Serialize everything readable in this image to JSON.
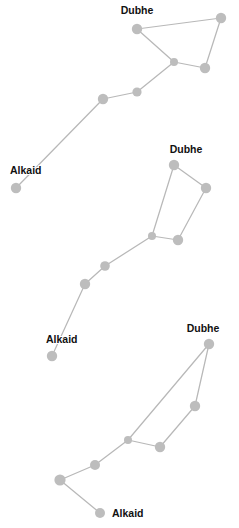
{
  "page": {
    "background_color": "#ffffff",
    "width": 239,
    "height": 528
  },
  "style": {
    "node_color": "#bdbdbd",
    "edge_color": "#b8b8b8",
    "label_color": "#111111",
    "edge_width": 1.25
  },
  "labels": {
    "dubhe": "Dubhe",
    "alkaid": "Alkaid"
  },
  "chart_data": {
    "type": "diagram",
    "xlabel": "",
    "ylabel": "",
    "xlim": [
      0,
      239
    ],
    "ylim": [
      0,
      528
    ],
    "grid": false,
    "legend": "none",
    "constellations": [
      {
        "name": "constellation-top",
        "stars": [
          {
            "id": "t0",
            "label": "Dubhe",
            "x": 137,
            "y": 29,
            "r": 5.2,
            "label_x": 137,
            "label_y": 14,
            "label_anchor": "middle"
          },
          {
            "id": "t1",
            "label": "",
            "x": 221,
            "y": 18,
            "r": 5.2
          },
          {
            "id": "t2",
            "label": "",
            "x": 205,
            "y": 68,
            "r": 5.2
          },
          {
            "id": "t3",
            "label": "",
            "x": 174,
            "y": 62,
            "r": 4.0
          },
          {
            "id": "t4",
            "label": "",
            "x": 137,
            "y": 92,
            "r": 4.6
          },
          {
            "id": "t5",
            "label": "",
            "x": 103,
            "y": 99,
            "r": 5.2
          },
          {
            "id": "t6",
            "label": "Alkaid",
            "x": 16,
            "y": 188,
            "r": 5.2,
            "label_x": 10,
            "label_y": 174,
            "label_anchor": "start"
          }
        ],
        "edges": [
          [
            "t0",
            "t1"
          ],
          [
            "t1",
            "t2"
          ],
          [
            "t2",
            "t3"
          ],
          [
            "t3",
            "t0"
          ],
          [
            "t3",
            "t4"
          ],
          [
            "t4",
            "t5"
          ],
          [
            "t5",
            "t6"
          ]
        ]
      },
      {
        "name": "constellation-middle",
        "stars": [
          {
            "id": "m0",
            "label": "Dubhe",
            "x": 174,
            "y": 165,
            "r": 5.2,
            "label_x": 186,
            "label_y": 153,
            "label_anchor": "middle"
          },
          {
            "id": "m1",
            "label": "",
            "x": 206,
            "y": 188,
            "r": 5.2
          },
          {
            "id": "m2",
            "label": "",
            "x": 178,
            "y": 240,
            "r": 5.2
          },
          {
            "id": "m3",
            "label": "",
            "x": 152,
            "y": 236,
            "r": 4.0
          },
          {
            "id": "m4",
            "label": "",
            "x": 105,
            "y": 266,
            "r": 4.8
          },
          {
            "id": "m5",
            "label": "",
            "x": 85,
            "y": 284,
            "r": 5.2
          },
          {
            "id": "m6",
            "label": "Alkaid",
            "x": 52,
            "y": 356,
            "r": 5.2,
            "label_x": 46,
            "label_y": 343,
            "label_anchor": "start"
          }
        ],
        "edges": [
          [
            "m0",
            "m1"
          ],
          [
            "m1",
            "m2"
          ],
          [
            "m2",
            "m3"
          ],
          [
            "m3",
            "m0"
          ],
          [
            "m3",
            "m4"
          ],
          [
            "m4",
            "m5"
          ],
          [
            "m5",
            "m6"
          ]
        ]
      },
      {
        "name": "constellation-bottom",
        "stars": [
          {
            "id": "b0",
            "label": "Dubhe",
            "x": 209,
            "y": 344,
            "r": 5.2,
            "label_x": 203,
            "label_y": 332,
            "label_anchor": "middle"
          },
          {
            "id": "b1",
            "label": "",
            "x": 195,
            "y": 406,
            "r": 5.2
          },
          {
            "id": "b2",
            "label": "",
            "x": 160,
            "y": 447,
            "r": 5.2
          },
          {
            "id": "b3",
            "label": "",
            "x": 128,
            "y": 440,
            "r": 4.0
          },
          {
            "id": "b4",
            "label": "",
            "x": 95,
            "y": 465,
            "r": 5.0
          },
          {
            "id": "b5",
            "label": "",
            "x": 60,
            "y": 480,
            "r": 5.6
          },
          {
            "id": "b6",
            "label": "Alkaid",
            "x": 100,
            "y": 513,
            "r": 5.0,
            "label_x": 112,
            "label_y": 517,
            "label_anchor": "start"
          }
        ],
        "edges": [
          [
            "b0",
            "b1"
          ],
          [
            "b1",
            "b2"
          ],
          [
            "b2",
            "b3"
          ],
          [
            "b3",
            "b0"
          ],
          [
            "b3",
            "b4"
          ],
          [
            "b4",
            "b5"
          ],
          [
            "b5",
            "b6"
          ]
        ]
      }
    ]
  }
}
